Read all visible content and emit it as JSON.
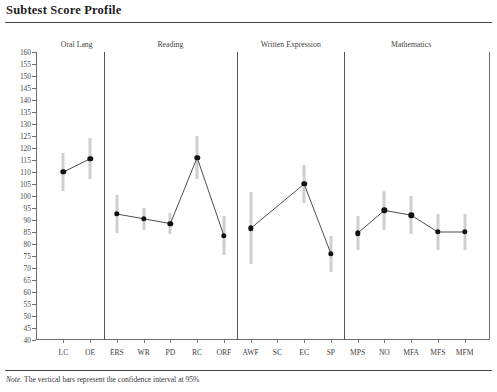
{
  "title": "Subtest Score Profile",
  "note_prefix": "Note.",
  "note_text": " The vertical bars represent the confidence interval at 95%",
  "colors": {
    "point": "#111111",
    "line": "#4d4d4d",
    "errorbar": "#cfcfcf",
    "axis": "#6d6d6d",
    "divider": "#555555"
  },
  "chart_data": {
    "type": "line",
    "title": "Subtest Score Profile",
    "xlabel": "",
    "ylabel": "",
    "ylim": [
      40,
      160
    ],
    "ytick_step": 5,
    "grid": false,
    "legend": null,
    "yticks": [
      160,
      155,
      150,
      145,
      140,
      135,
      130,
      125,
      120,
      115,
      110,
      105,
      100,
      95,
      90,
      85,
      80,
      75,
      70,
      65,
      60,
      55,
      50,
      45,
      40
    ],
    "sections": [
      {
        "name": "Oral Lang",
        "categories": [
          "LC",
          "OE"
        ],
        "values": [
          110,
          115.5
        ],
        "ci_low": [
          102,
          107
        ],
        "ci_high": [
          118,
          124
        ]
      },
      {
        "name": "Reading",
        "categories": [
          "ERS",
          "WR",
          "PD",
          "RC",
          "ORF"
        ],
        "values": [
          92.5,
          90.5,
          88.5,
          116,
          83.5
        ],
        "ci_low": [
          84.5,
          86,
          84,
          107,
          75.5
        ],
        "ci_high": [
          100.5,
          95,
          93,
          125,
          91.5
        ]
      },
      {
        "name": "Written Expression",
        "categories": [
          "AWF",
          "SC",
          "EC",
          "SP"
        ],
        "values": [
          86.5,
          null,
          105,
          76
        ],
        "ci_low": [
          71.5,
          null,
          97,
          68.5
        ],
        "ci_high": [
          101.5,
          null,
          113,
          83.5
        ]
      },
      {
        "name": "Mathematics",
        "categories": [
          "MPS",
          "NO",
          "MFA",
          "MFS",
          "MFM"
        ],
        "values": [
          84.5,
          94,
          92,
          85,
          85
        ],
        "ci_low": [
          77.5,
          86,
          84,
          77.5,
          77.5
        ],
        "ci_high": [
          91.5,
          102,
          100,
          92.5,
          92.5
        ]
      }
    ]
  }
}
